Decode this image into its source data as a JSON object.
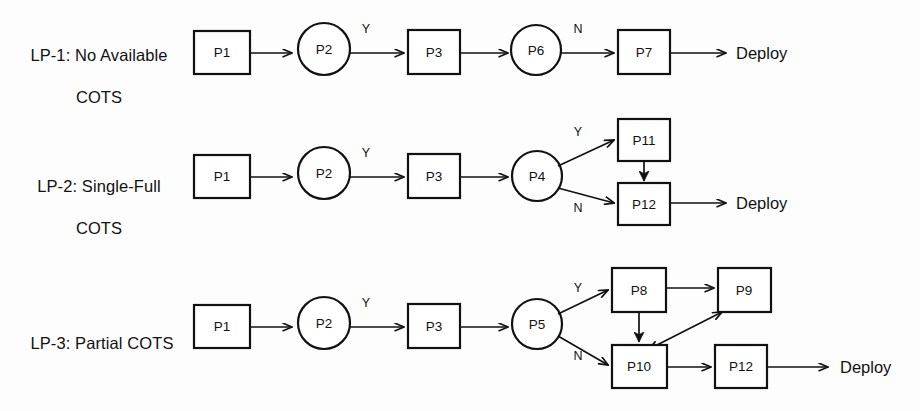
{
  "diagram": {
    "background_color": "#fdfdfd",
    "stroke_color": "#111111",
    "fill_color": "#ffffff",
    "deploy_label": "Deploy",
    "branch_yes": "Y",
    "branch_no": "N",
    "lanes": [
      {
        "id": "lp1",
        "label": "LP-1: No Available\nCOTS",
        "label_line1": "LP-1: No Available",
        "label_line2": "COTS",
        "nodes": [
          {
            "id": "lp1-p1",
            "text": "P1",
            "shape": "rect"
          },
          {
            "id": "lp1-p2",
            "text": "P2",
            "shape": "circle"
          },
          {
            "id": "lp1-p3",
            "text": "P3",
            "shape": "rect"
          },
          {
            "id": "lp1-p6",
            "text": "P6",
            "shape": "circle"
          },
          {
            "id": "lp1-p7",
            "text": "P7",
            "shape": "rect"
          }
        ],
        "edges": [
          {
            "from": "P1",
            "to": "P2",
            "label": ""
          },
          {
            "from": "P2",
            "to": "P3",
            "label": "Y"
          },
          {
            "from": "P3",
            "to": "P6",
            "label": ""
          },
          {
            "from": "P6",
            "to": "P7",
            "label": "N"
          },
          {
            "from": "P7",
            "to": "Deploy",
            "label": ""
          }
        ],
        "terminal": "Deploy"
      },
      {
        "id": "lp2",
        "label": "LP-2: Single-Full\nCOTS",
        "label_line1": "LP-2: Single-Full",
        "label_line2": "COTS",
        "nodes": [
          {
            "id": "lp2-p1",
            "text": "P1",
            "shape": "rect"
          },
          {
            "id": "lp2-p2",
            "text": "P2",
            "shape": "circle"
          },
          {
            "id": "lp2-p3",
            "text": "P3",
            "shape": "rect"
          },
          {
            "id": "lp2-p4",
            "text": "P4",
            "shape": "circle"
          },
          {
            "id": "lp2-p11",
            "text": "P11",
            "shape": "rect"
          },
          {
            "id": "lp2-p12",
            "text": "P12",
            "shape": "rect"
          }
        ],
        "edges": [
          {
            "from": "P1",
            "to": "P2",
            "label": ""
          },
          {
            "from": "P2",
            "to": "P3",
            "label": "Y"
          },
          {
            "from": "P3",
            "to": "P4",
            "label": ""
          },
          {
            "from": "P4",
            "to": "P11",
            "label": "Y"
          },
          {
            "from": "P4",
            "to": "P12",
            "label": "N"
          },
          {
            "from": "P11",
            "to": "P12",
            "label": ""
          },
          {
            "from": "P12",
            "to": "Deploy",
            "label": ""
          }
        ],
        "terminal": "Deploy"
      },
      {
        "id": "lp3",
        "label": "LP-3: Partial COTS",
        "label_line1": "LP-3: Partial COTS",
        "label_line2": "",
        "nodes": [
          {
            "id": "lp3-p1",
            "text": "P1",
            "shape": "rect"
          },
          {
            "id": "lp3-p2",
            "text": "P2",
            "shape": "circle"
          },
          {
            "id": "lp3-p3",
            "text": "P3",
            "shape": "rect"
          },
          {
            "id": "lp3-p5",
            "text": "P5",
            "shape": "circle"
          },
          {
            "id": "lp3-p8",
            "text": "P8",
            "shape": "rect"
          },
          {
            "id": "lp3-p9",
            "text": "P9",
            "shape": "rect"
          },
          {
            "id": "lp3-p10",
            "text": "P10",
            "shape": "rect"
          },
          {
            "id": "lp3-p12",
            "text": "P12",
            "shape": "rect"
          }
        ],
        "edges": [
          {
            "from": "P1",
            "to": "P2",
            "label": ""
          },
          {
            "from": "P2",
            "to": "P3",
            "label": "Y"
          },
          {
            "from": "P3",
            "to": "P5",
            "label": ""
          },
          {
            "from": "P5",
            "to": "P8",
            "label": "Y"
          },
          {
            "from": "P5",
            "to": "P10",
            "label": "N"
          },
          {
            "from": "P8",
            "to": "P9",
            "label": ""
          },
          {
            "from": "P8",
            "to": "P10",
            "label": ""
          },
          {
            "from": "P10",
            "to": "P9",
            "label": "",
            "bidirectional": true
          },
          {
            "from": "P10",
            "to": "P12",
            "label": ""
          },
          {
            "from": "P12",
            "to": "Deploy",
            "label": ""
          }
        ],
        "terminal": "Deploy"
      }
    ]
  }
}
